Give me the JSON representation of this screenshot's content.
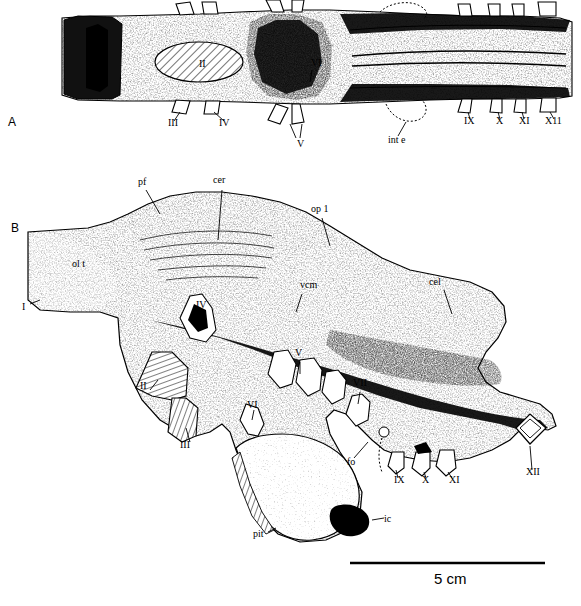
{
  "figure": {
    "panels": [
      {
        "id": "A",
        "letter": "A",
        "x": 8,
        "y": 116
      },
      {
        "id": "B",
        "letter": "B",
        "x": 11,
        "y": 222
      }
    ],
    "scale_bar": {
      "label": "5 cm",
      "x": 350,
      "y": 572,
      "bar_x1": 350,
      "bar_x2": 545,
      "bar_y": 563
    },
    "panel_a_labels": [
      {
        "text": "I",
        "x": 92,
        "y": 62
      },
      {
        "text": "II",
        "x": 199,
        "y": 65
      },
      {
        "text": "III",
        "x": 168,
        "y": 124
      },
      {
        "text": "IV",
        "x": 219,
        "y": 124
      },
      {
        "text": "V",
        "x": 297,
        "y": 145
      },
      {
        "text": "VI",
        "x": 311,
        "y": 64
      },
      {
        "text": "IX",
        "x": 466,
        "y": 122
      },
      {
        "text": "X",
        "x": 497,
        "y": 122
      },
      {
        "text": "XI",
        "x": 521,
        "y": 122
      },
      {
        "text": "X11",
        "x": 548,
        "y": 122
      },
      {
        "text": "int e",
        "x": 391,
        "y": 140
      }
    ],
    "panel_b_labels": [
      {
        "text": "pf",
        "x": 138,
        "y": 182
      },
      {
        "text": "cer",
        "x": 215,
        "y": 180
      },
      {
        "text": "op 1",
        "x": 313,
        "y": 209
      },
      {
        "text": "ol t",
        "x": 74,
        "y": 264
      },
      {
        "text": "vcm",
        "x": 302,
        "y": 285
      },
      {
        "text": "cel",
        "x": 431,
        "y": 282
      },
      {
        "text": "I",
        "x": 22,
        "y": 308
      },
      {
        "text": "IV",
        "x": 198,
        "y": 306
      },
      {
        "text": "II",
        "x": 142,
        "y": 387
      },
      {
        "text": "III",
        "x": 182,
        "y": 446
      },
      {
        "text": "V",
        "x": 296,
        "y": 354
      },
      {
        "text": "VI",
        "x": 249,
        "y": 406
      },
      {
        "text": "VII",
        "x": 355,
        "y": 384
      },
      {
        "text": "fo",
        "x": 349,
        "y": 463
      },
      {
        "text": "IX",
        "x": 396,
        "y": 481
      },
      {
        "text": "X",
        "x": 424,
        "y": 481
      },
      {
        "text": "XI",
        "x": 451,
        "y": 481
      },
      {
        "text": "XII",
        "x": 528,
        "y": 473
      },
      {
        "text": "pit",
        "x": 255,
        "y": 535
      },
      {
        "text": "ic",
        "x": 386,
        "y": 520
      }
    ]
  }
}
